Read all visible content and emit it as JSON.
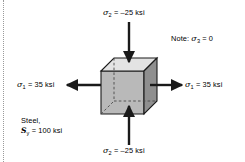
{
  "figure": {
    "note": "Note: σ₃ = 0",
    "note_prefix": "Note: ",
    "note_symbol": "σ",
    "note_sub": "3",
    "note_value": " = 0",
    "material_line1": "Steel,",
    "material_symbol": "S",
    "material_sub": "y",
    "material_value": " = 100 ksi"
  },
  "labels": {
    "sigma1_left": {
      "symbol": "σ",
      "sub": "1",
      "value": " = 35 ksi",
      "full": "σ₁ = 35 ksi"
    },
    "sigma1_right": {
      "symbol": "σ",
      "sub": "1",
      "value": " = 35 ksi",
      "full": "σ₁ = 35 ksi"
    },
    "sigma2_top": {
      "symbol": "σ",
      "sub": "2",
      "value": " = –25 ksi",
      "full": "σ₂ = –25 ksi"
    },
    "sigma2_bottom": {
      "symbol": "σ",
      "sub": "2",
      "value": " = –25 ksi",
      "full": "σ₂ = –25 ksi"
    }
  },
  "stresses": {
    "sigma1": {
      "value": 35,
      "units": "ksi",
      "sense": "tension",
      "axis": "horizontal"
    },
    "sigma2": {
      "value": -25,
      "units": "ksi",
      "sense": "compression",
      "axis": "vertical"
    },
    "sigma3": {
      "value": 0,
      "units": "ksi",
      "sense": "none",
      "axis": "out-of-plane"
    },
    "yield_strength": {
      "value": 100,
      "units": "ksi",
      "symbol": "Sy"
    },
    "material": "Steel"
  },
  "colors": {
    "front_face": "#b8b8b8",
    "top_face": "#e2e2e2",
    "side_face": "#8f8f8f",
    "outline": "#1a1a1a",
    "arrow": "#1a1a1a",
    "hidden_edge": "#555555",
    "text": "#000000",
    "background": "#ffffff",
    "rule": "#9a9a9a"
  }
}
